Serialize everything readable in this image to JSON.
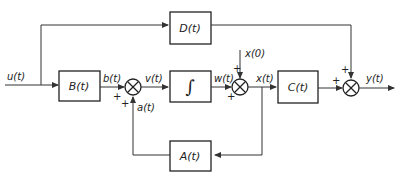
{
  "diagram": {
    "type": "block-diagram",
    "blocks": {
      "B": {
        "label": "B(t)"
      },
      "D": {
        "label": "D(t)"
      },
      "integrator": {
        "label": "∫"
      },
      "C": {
        "label": "C(t)"
      },
      "A": {
        "label": "A(t)"
      }
    },
    "signals": {
      "u": "u(t)",
      "b": "b(t)",
      "v": "v(t)",
      "a": "a(t)",
      "w": "w(t)",
      "x0": "x(0)",
      "x": "x(t)",
      "y": "y(t)"
    },
    "signs": {
      "plus": "+"
    }
  }
}
